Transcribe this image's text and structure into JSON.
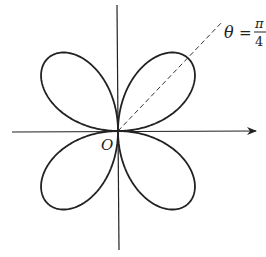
{
  "diagram": {
    "type": "polar-rose",
    "petals": 4,
    "origin_label": "O",
    "ray_label": {
      "theta": "θ",
      "equals": "=",
      "numerator": "π",
      "denominator": "4"
    },
    "colors": {
      "stroke": "#222222",
      "background": "#ffffff"
    }
  }
}
